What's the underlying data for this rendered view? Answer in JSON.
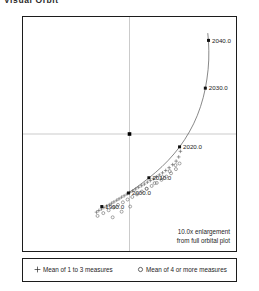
{
  "title": "Visual Orbit",
  "plot": {
    "enlargement_note_line1": "10.0x enlargement",
    "enlargement_note_line2": "from full orbital plot",
    "primary_star_marker": "filled-square",
    "axes": "crosshair"
  },
  "legend": {
    "entries": [
      {
        "marker": "plus",
        "label": "Mean of 1 to 3 measures"
      },
      {
        "marker": "circle",
        "label": "Mean of 4 or more measures"
      }
    ]
  },
  "chart_data": {
    "type": "scatter",
    "title": "Visual Orbit",
    "xlabel": "",
    "ylabel": "",
    "xlim": [
      -1.0,
      1.0
    ],
    "ylim": [
      -1.0,
      1.0
    ],
    "grid": false,
    "legend_position": "below-plot",
    "annotations": [
      "10.0x enlargement",
      "from full orbital plot"
    ],
    "origin": {
      "x": 0.0,
      "y": 0.0,
      "marker": "filled-square",
      "name": "primary-star"
    },
    "series": [
      {
        "name": "Orbit ephemeris curve",
        "type": "line",
        "x": [
          0.735,
          0.742,
          0.745,
          0.744,
          0.738,
          0.727,
          0.712,
          0.692,
          0.667,
          0.637,
          0.602,
          0.562,
          0.518,
          0.47,
          0.418,
          0.363,
          0.305,
          0.245,
          0.183,
          0.12,
          0.058,
          -0.003
        ],
        "y": [
          0.862,
          0.79,
          0.712,
          0.632,
          0.551,
          0.47,
          0.39,
          0.311,
          0.234,
          0.159,
          0.087,
          0.018,
          -0.048,
          -0.111,
          -0.17,
          -0.226,
          -0.279,
          -0.328,
          -0.375,
          -0.419,
          -0.461,
          -0.5
        ]
      },
      {
        "name": "Epoch tick marks",
        "type": "scatter",
        "marker": "filled-square",
        "points": [
          {
            "label": "2040.0",
            "x": 0.742,
            "y": 0.8
          },
          {
            "label": "2030.0",
            "x": 0.712,
            "y": 0.392
          },
          {
            "label": "2020.0",
            "x": 0.47,
            "y": -0.11
          },
          {
            "label": "2010.0",
            "x": 0.182,
            "y": -0.374
          },
          {
            "label": "2000.0",
            "x": -0.01,
            "y": -0.504
          },
          {
            "label": "1990.0",
            "x": -0.26,
            "y": -0.62
          }
        ]
      },
      {
        "name": "Mean of 1 to 3 measures",
        "marker": "plus",
        "x": [
          -0.31,
          -0.288,
          -0.263,
          -0.24,
          -0.215,
          -0.19,
          -0.168,
          -0.146,
          -0.12,
          -0.098,
          -0.074,
          -0.05,
          -0.024,
          0.003,
          0.03,
          0.058,
          0.086,
          0.114,
          0.14,
          0.168,
          0.196,
          0.224,
          0.252,
          0.28,
          0.31,
          0.34,
          0.372,
          0.405,
          0.438,
          0.462,
          0.478
        ],
        "y": [
          -0.668,
          -0.654,
          -0.64,
          -0.628,
          -0.616,
          -0.604,
          -0.592,
          -0.58,
          -0.566,
          -0.554,
          -0.54,
          -0.528,
          -0.514,
          -0.5,
          -0.486,
          -0.47,
          -0.456,
          -0.442,
          -0.428,
          -0.412,
          -0.398,
          -0.382,
          -0.366,
          -0.35,
          -0.332,
          -0.312,
          -0.288,
          -0.262,
          -0.232,
          -0.196,
          -0.148
        ]
      },
      {
        "name": "Mean of 4 or more measures",
        "marker": "circle",
        "x": [
          -0.3,
          -0.246,
          -0.196,
          -0.15,
          -0.108,
          -0.062,
          -0.018,
          0.026,
          0.07,
          0.116,
          0.162,
          0.208,
          0.256,
          0.3,
          0.346,
          0.39,
          0.436,
          0.47,
          0.16,
          0.236,
          0.31,
          0.378,
          0.432,
          -0.158,
          -0.074,
          0.006
        ],
        "y": [
          -0.7,
          -0.676,
          -0.652,
          -0.628,
          -0.606,
          -0.584,
          -0.56,
          -0.538,
          -0.516,
          -0.492,
          -0.468,
          -0.444,
          -0.418,
          -0.392,
          -0.364,
          -0.336,
          -0.3,
          -0.252,
          -0.468,
          -0.42,
          -0.368,
          -0.318,
          -0.266,
          -0.712,
          -0.664,
          -0.62
        ]
      }
    ]
  }
}
